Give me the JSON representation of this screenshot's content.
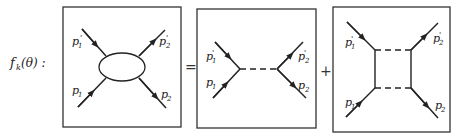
{
  "equation": {
    "lhs": "f_k(θ) :",
    "lhs_main": "f",
    "lhs_sub": "k",
    "lhs_arg": "(θ) :",
    "equals": "=",
    "plus": "+"
  },
  "diagrams": [
    {
      "name": "full-amplitude-blob",
      "labels": {
        "p1": "p",
        "p1_sub": "1",
        "p1p": "p",
        "p1p_sub": "1",
        "p1p_prime": "'",
        "p2": "p",
        "p2_sub": "2",
        "p2p": "p",
        "p2p_sub": "2",
        "p2p_prime": "'"
      }
    },
    {
      "name": "single-exchange",
      "labels": {
        "p1": "p",
        "p1_sub": "1",
        "p1p": "p",
        "p1p_sub": "1",
        "p1p_prime": "'",
        "p2": "p",
        "p2_sub": "2",
        "p2p": "p",
        "p2p_sub": "2",
        "p2p_prime": "'"
      }
    },
    {
      "name": "box-diagram",
      "labels": {
        "p1": "p",
        "p1_sub": "1",
        "p1p": "p",
        "p1p_sub": "1",
        "p1p_prime": "'",
        "p2": "p",
        "p2_sub": "2",
        "p2p": "p",
        "p2p_sub": "2",
        "p2p_prime": "'"
      }
    }
  ],
  "colors": {
    "ink": "#222222",
    "frame": "#333333",
    "background": "#ffffff"
  }
}
